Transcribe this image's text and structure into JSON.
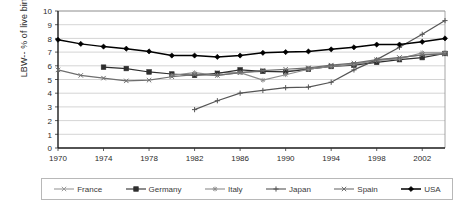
{
  "chart_data": {
    "type": "line",
    "title": "",
    "xlabel": "",
    "ylabel": "LBW-- % of live births",
    "xlim": [
      1970,
      2004
    ],
    "ylim": [
      0,
      10
    ],
    "ytick_step": 1,
    "yticks": [
      "0",
      "1",
      "2",
      "3",
      "4",
      "5",
      "6",
      "7",
      "8",
      "9",
      "10"
    ],
    "xticks": [
      "1970",
      "1974",
      "1978",
      "1982",
      "1986",
      "1990",
      "1994",
      "1998",
      "2002"
    ],
    "grid": "horizontal",
    "legend_position": "bottom",
    "x": [
      1970,
      1972,
      1974,
      1976,
      1978,
      1980,
      1982,
      1984,
      1986,
      1988,
      1990,
      1992,
      1994,
      1996,
      1998,
      2000,
      2002,
      2004
    ],
    "series": [
      {
        "name": "France",
        "color": "#9a9a9a",
        "marker": "cross",
        "values": [
          null,
          null,
          null,
          null,
          null,
          null,
          null,
          5.5,
          5.5,
          5.6,
          5.6,
          5.8,
          6.0,
          6.1,
          6.4,
          6.6,
          6.8,
          6.9
        ]
      },
      {
        "name": "Germany",
        "color": "#2e2e2e",
        "marker": "square",
        "values": [
          null,
          null,
          5.9,
          5.8,
          5.55,
          5.4,
          5.3,
          5.45,
          5.7,
          5.6,
          5.55,
          5.75,
          5.95,
          6.05,
          6.25,
          6.45,
          6.6,
          6.9
        ]
      },
      {
        "name": "Italy",
        "color": "#8c8c8c",
        "marker": "star",
        "values": [
          null,
          null,
          null,
          null,
          null,
          5.3,
          5.5,
          5.3,
          5.5,
          4.95,
          5.35,
          5.75,
          5.95,
          6.1,
          6.4,
          6.5,
          6.95,
          6.95
        ]
      },
      {
        "name": "Japan",
        "color": "#555555",
        "marker": "plus",
        "values": [
          null,
          null,
          null,
          null,
          null,
          null,
          2.8,
          3.45,
          4.0,
          4.2,
          4.4,
          4.45,
          4.8,
          5.7,
          6.45,
          7.35,
          8.3,
          9.3
        ]
      },
      {
        "name": "Spain",
        "color": "#6e6e6e",
        "marker": "cross",
        "values": [
          5.7,
          5.3,
          5.1,
          4.9,
          4.95,
          5.2,
          5.35,
          5.3,
          5.5,
          5.65,
          5.75,
          5.85,
          6.05,
          6.2,
          6.45,
          6.6,
          6.8,
          6.85
        ]
      },
      {
        "name": "USA",
        "color": "#000000",
        "marker": "diamond",
        "values": [
          7.9,
          7.6,
          7.4,
          7.25,
          7.05,
          6.75,
          6.75,
          6.65,
          6.75,
          6.95,
          7.0,
          7.05,
          7.2,
          7.35,
          7.55,
          7.55,
          7.75,
          8.0
        ]
      }
    ]
  },
  "legend": {
    "items": [
      {
        "label": "France"
      },
      {
        "label": "Germany"
      },
      {
        "label": "Italy"
      },
      {
        "label": "Japan"
      },
      {
        "label": "Spain"
      },
      {
        "label": "USA"
      }
    ]
  }
}
